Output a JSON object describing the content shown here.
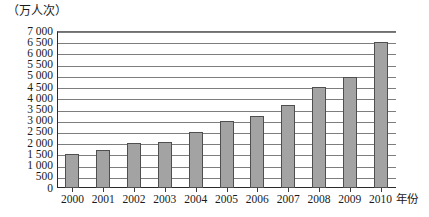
{
  "chart_data": {
    "type": "bar",
    "title": "",
    "subtitle": "",
    "xlabel": "年份",
    "ylabel": "（万人次）",
    "categories": [
      "2000",
      "2001",
      "2002",
      "2003",
      "2004",
      "2005",
      "2006",
      "2007",
      "2008",
      "2009",
      "2010"
    ],
    "values": [
      1500,
      1700,
      2000,
      2050,
      2500,
      3000,
      3200,
      3700,
      4500,
      4950,
      6500
    ],
    "ylim": [
      0,
      7000
    ],
    "ytick_step": 500,
    "yticks": [
      0,
      500,
      1000,
      1500,
      2000,
      2500,
      3000,
      3500,
      4000,
      4500,
      5000,
      5500,
      6000,
      6500,
      7000
    ],
    "ytick_labels": [
      "0",
      "500",
      "1 000",
      "1 500",
      "2 000",
      "2 500",
      "3 000",
      "3 500",
      "4 000",
      "4 500",
      "5 000",
      "5 500",
      "6 000",
      "6 500",
      "7 000"
    ],
    "grid": true,
    "legend": false,
    "legend_position": "none",
    "series": [
      {
        "name": "万人次",
        "values": [
          1500,
          1700,
          2000,
          2050,
          2500,
          3000,
          3200,
          3700,
          4500,
          4950,
          6500
        ]
      }
    ],
    "colors": {
      "bar_fill": "#a3a3a3",
      "bar_border": "#4f4f4f",
      "gridline": "#7d7d7d",
      "axis": "#2a2a2a",
      "text": "#1a1a1a",
      "background": "#ffffff"
    }
  }
}
